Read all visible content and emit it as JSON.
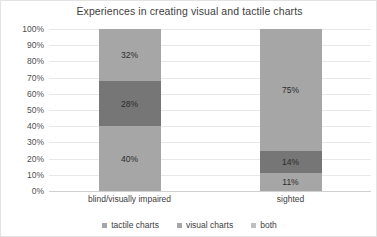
{
  "chart_data": {
    "type": "bar",
    "subtype": "stacked-percent",
    "title": "Experiences in creating visual and tactile charts",
    "xlabel": "",
    "ylabel": "",
    "categories": [
      "blind/visually impaired",
      "sighted"
    ],
    "series": [
      {
        "name": "tactile charts",
        "color": "#a6a6a6",
        "values": [
          40,
          11
        ],
        "labels": [
          "40%",
          "11%"
        ]
      },
      {
        "name": "visual charts",
        "color": "#767676",
        "values": [
          28,
          14
        ],
        "labels": [
          "28%",
          "14%"
        ]
      },
      {
        "name": "both",
        "color": "#a6a6a6",
        "values": [
          32,
          75
        ],
        "labels": [
          "32%",
          "75%"
        ]
      }
    ],
    "ylim": [
      0,
      100
    ],
    "y_tick_values": [
      100,
      90,
      80,
      70,
      60,
      50,
      40,
      30,
      20,
      10,
      0
    ],
    "y_tick_labels": [
      "100%",
      "90%",
      "80%",
      "70%",
      "60%",
      "50%",
      "40%",
      "30%",
      "20%",
      "10%",
      "0%"
    ],
    "grid": true,
    "legend_position": "bottom"
  },
  "legend": {
    "items": [
      {
        "label": "tactile charts",
        "color": "#a6a6a6"
      },
      {
        "label": "visual charts",
        "color": "#a6a6a6"
      },
      {
        "label": "both",
        "color": "#bfbfbf"
      }
    ]
  },
  "colors": {
    "background": "#ffffff",
    "gridline": "#e8e8e8",
    "axis": "#d0d0d0",
    "light_segment": "#a6a6a6",
    "dark_segment": "#767676",
    "title_text": "#404040",
    "tick_text": "#505050",
    "bar_label_text": "#2b2b2b"
  }
}
